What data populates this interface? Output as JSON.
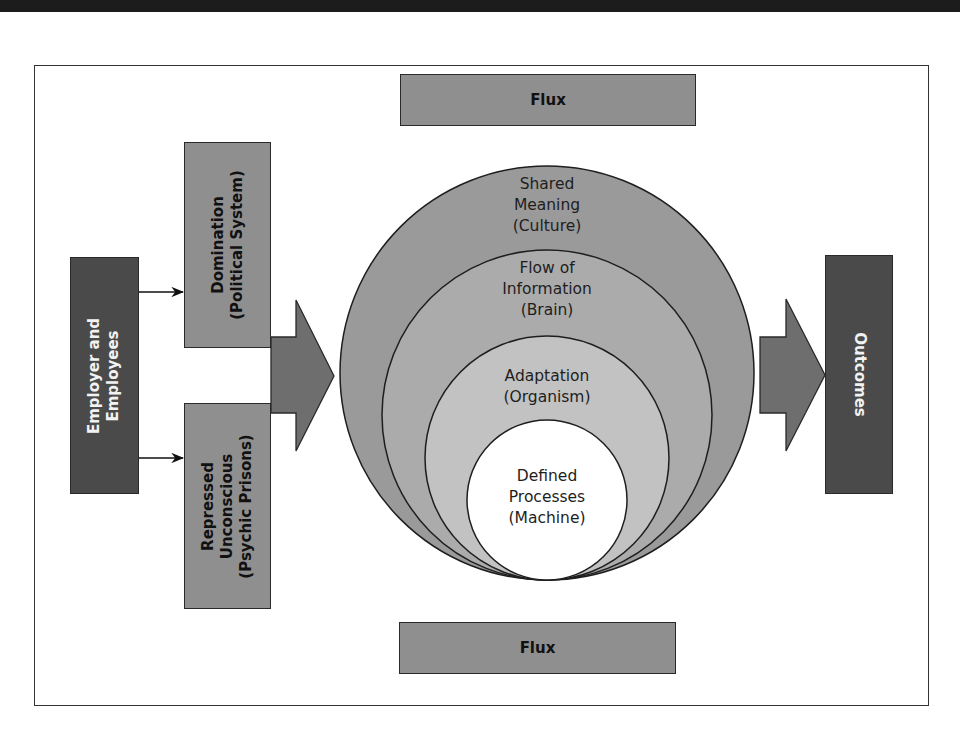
{
  "diagram": {
    "title": "",
    "flux_top": {
      "label": "Flux"
    },
    "flux_bottom": {
      "label": "Flux"
    },
    "source": {
      "lines": [
        "Employer and",
        "Employees"
      ]
    },
    "inputs": [
      {
        "lines": [
          "Domination",
          "(Political System)"
        ]
      },
      {
        "lines": [
          "Repressed",
          "Unconscious",
          "(Psychic Prisons)"
        ]
      }
    ],
    "rings": [
      {
        "lines": [
          "Shared",
          "Meaning",
          "(Culture)"
        ]
      },
      {
        "lines": [
          "Flow of",
          "Information",
          "(Brain)"
        ]
      },
      {
        "lines": [
          "Adaptation",
          "(Organism)"
        ]
      },
      {
        "lines": [
          "Defined",
          "Processes",
          "(Machine)"
        ]
      }
    ],
    "output": {
      "label": "Outcomes"
    },
    "colors": {
      "ring_outer": "#9a9a9a",
      "ring_2": "#ababab",
      "ring_3": "#c2c2c2",
      "ring_inner": "#ffffff",
      "arrow": "#6e6e6e",
      "box_light": "#8f8f8f",
      "box_dark": "#4a4a4a"
    }
  }
}
